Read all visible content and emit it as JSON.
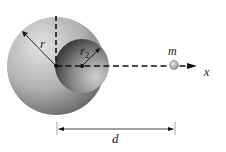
{
  "diagram": {
    "labels": {
      "r": "r",
      "r2": "r",
      "r2_sub": "2",
      "m": "m",
      "x": "x",
      "d": "d"
    },
    "colors": {
      "sphere_light": "#d8d8d8",
      "sphere_dark": "#6a6a6a",
      "cavity_dark": "#3a3a3a",
      "cavity_light": "#c8c8c8",
      "mass": "#b8b8b8",
      "line": "#111111"
    }
  }
}
